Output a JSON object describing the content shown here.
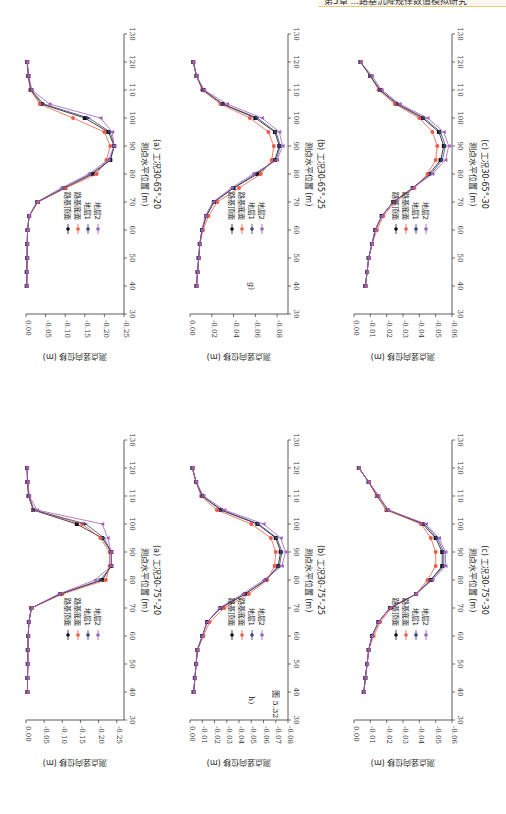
{
  "header": {
    "running_title": "第5章 ...路基沉降规律数值模拟研究"
  },
  "figure": {
    "number_label": "图 5.32",
    "row_labels": [
      "g)",
      "h)"
    ]
  },
  "legend": {
    "items": [
      {
        "label": "路基顶面",
        "color": "#111111",
        "marker": "square"
      },
      {
        "label": "路基底面",
        "color": "#ee5a45",
        "marker": "circle"
      },
      {
        "label": "地层1",
        "color": "#3b3f7a",
        "marker": "triangle-up"
      },
      {
        "label": "地层2",
        "color": "#a060b8",
        "marker": "triangle-down"
      }
    ]
  },
  "axes": {
    "xlabel": "测点水平位置 (m)",
    "ylabel": "测点竖向位移 (m)",
    "xticks": [
      30,
      40,
      50,
      60,
      70,
      80,
      90,
      100,
      110,
      120,
      130
    ]
  },
  "chart_data": [
    {
      "type": "line",
      "id": "g_a",
      "title": "(a) 工况30-65°-20",
      "xlabel": "测点水平位置 (m)",
      "ylabel": "测点竖向位移 (m)",
      "xlim": [
        30,
        130
      ],
      "ylim": [
        -0.25,
        0.0
      ],
      "yticks": [
        0.0,
        -0.05,
        -0.1,
        -0.15,
        -0.2,
        -0.25
      ],
      "x": [
        40,
        45,
        50,
        55,
        60,
        65,
        70,
        75,
        80,
        85,
        90,
        95,
        100,
        105,
        110,
        115,
        120
      ],
      "series": [
        {
          "name": "路基顶面",
          "values": [
            -0.002,
            -0.002,
            -0.003,
            -0.003,
            -0.004,
            -0.008,
            -0.03,
            -0.1,
            -0.17,
            -0.215,
            -0.225,
            -0.21,
            -0.15,
            -0.04,
            -0.012,
            -0.006,
            -0.003
          ]
        },
        {
          "name": "路基底面",
          "values": [
            -0.002,
            -0.002,
            -0.003,
            -0.003,
            -0.004,
            -0.008,
            -0.03,
            -0.1,
            -0.18,
            -0.205,
            -0.215,
            -0.2,
            -0.12,
            -0.035,
            -0.011,
            -0.005,
            -0.003
          ]
        },
        {
          "name": "地层1",
          "values": [
            -0.002,
            -0.002,
            -0.003,
            -0.003,
            -0.004,
            -0.008,
            -0.028,
            -0.095,
            -0.165,
            -0.215,
            -0.225,
            -0.215,
            -0.16,
            -0.045,
            -0.013,
            -0.006,
            -0.003
          ]
        },
        {
          "name": "地层2",
          "values": [
            -0.002,
            -0.002,
            -0.003,
            -0.003,
            -0.004,
            -0.008,
            -0.028,
            -0.09,
            -0.16,
            -0.21,
            -0.225,
            -0.22,
            -0.19,
            -0.06,
            -0.015,
            -0.007,
            -0.003
          ]
        }
      ]
    },
    {
      "type": "line",
      "id": "g_b",
      "title": "(b) 工况30-65°-25",
      "xlabel": "测点水平位置 (m)",
      "ylabel": "测点竖向位移 (m)",
      "xlim": [
        30,
        130
      ],
      "ylim": [
        -0.09,
        0.0
      ],
      "yticks": [
        0.0,
        -0.02,
        -0.04,
        -0.06,
        -0.08
      ],
      "x": [
        40,
        45,
        50,
        55,
        60,
        65,
        70,
        75,
        80,
        85,
        90,
        95,
        100,
        105,
        110,
        115,
        120
      ],
      "series": [
        {
          "name": "路基顶面",
          "values": [
            -0.006,
            -0.007,
            -0.008,
            -0.009,
            -0.011,
            -0.015,
            -0.022,
            -0.04,
            -0.062,
            -0.078,
            -0.082,
            -0.078,
            -0.06,
            -0.03,
            -0.012,
            -0.006,
            -0.003
          ]
        },
        {
          "name": "路基底面",
          "values": [
            -0.006,
            -0.007,
            -0.008,
            -0.009,
            -0.012,
            -0.017,
            -0.025,
            -0.045,
            -0.065,
            -0.075,
            -0.077,
            -0.072,
            -0.055,
            -0.028,
            -0.011,
            -0.006,
            -0.003
          ]
        },
        {
          "name": "地层1",
          "values": [
            -0.006,
            -0.007,
            -0.008,
            -0.009,
            -0.011,
            -0.015,
            -0.022,
            -0.04,
            -0.06,
            -0.079,
            -0.083,
            -0.079,
            -0.062,
            -0.03,
            -0.012,
            -0.006,
            -0.003
          ]
        },
        {
          "name": "地层2",
          "values": [
            -0.006,
            -0.007,
            -0.008,
            -0.009,
            -0.011,
            -0.014,
            -0.021,
            -0.038,
            -0.058,
            -0.08,
            -0.085,
            -0.082,
            -0.066,
            -0.034,
            -0.013,
            -0.006,
            -0.003
          ]
        }
      ]
    },
    {
      "type": "line",
      "id": "g_c",
      "title": "(c) 工况30-65°-30",
      "xlabel": "测点水平位置 (m)",
      "ylabel": "测点竖向位移 (m)",
      "xlim": [
        30,
        130
      ],
      "ylim": [
        -0.06,
        0.0
      ],
      "yticks": [
        0.0,
        -0.01,
        -0.02,
        -0.03,
        -0.04,
        -0.05,
        -0.06
      ],
      "x": [
        40,
        45,
        50,
        55,
        60,
        65,
        70,
        75,
        80,
        85,
        90,
        95,
        100,
        105,
        110,
        115,
        120
      ],
      "series": [
        {
          "name": "路基顶面",
          "values": [
            -0.007,
            -0.008,
            -0.009,
            -0.011,
            -0.013,
            -0.017,
            -0.024,
            -0.036,
            -0.046,
            -0.053,
            -0.055,
            -0.052,
            -0.042,
            -0.026,
            -0.016,
            -0.01,
            -0.004
          ]
        },
        {
          "name": "路基底面",
          "values": [
            -0.007,
            -0.008,
            -0.009,
            -0.011,
            -0.014,
            -0.018,
            -0.025,
            -0.037,
            -0.045,
            -0.05,
            -0.051,
            -0.048,
            -0.04,
            -0.025,
            -0.015,
            -0.01,
            -0.004
          ]
        },
        {
          "name": "地层1",
          "values": [
            -0.007,
            -0.008,
            -0.009,
            -0.011,
            -0.013,
            -0.017,
            -0.024,
            -0.036,
            -0.047,
            -0.054,
            -0.056,
            -0.053,
            -0.043,
            -0.027,
            -0.016,
            -0.01,
            -0.004
          ]
        },
        {
          "name": "地层2",
          "values": [
            -0.007,
            -0.008,
            -0.009,
            -0.011,
            -0.013,
            -0.017,
            -0.024,
            -0.036,
            -0.048,
            -0.056,
            -0.058,
            -0.055,
            -0.045,
            -0.028,
            -0.017,
            -0.011,
            -0.004
          ]
        }
      ]
    },
    {
      "type": "line",
      "id": "h_a",
      "title": "(a) 工况30-75°-20",
      "xlabel": "测点水平位置 (m)",
      "ylabel": "测点竖向位移 (m)",
      "xlim": [
        30,
        130
      ],
      "ylim": [
        -0.27,
        0.0
      ],
      "yticks": [
        0.0,
        -0.05,
        -0.1,
        -0.15,
        -0.2,
        -0.25
      ],
      "x": [
        40,
        45,
        50,
        55,
        60,
        65,
        70,
        75,
        80,
        85,
        90,
        95,
        100,
        105,
        110,
        115,
        120
      ],
      "series": [
        {
          "name": "路基顶面",
          "values": [
            -0.004,
            -0.004,
            -0.005,
            -0.005,
            -0.006,
            -0.008,
            -0.015,
            -0.095,
            -0.21,
            -0.235,
            -0.235,
            -0.21,
            -0.14,
            -0.02,
            -0.007,
            -0.004,
            -0.003
          ]
        },
        {
          "name": "路基底面",
          "values": [
            -0.004,
            -0.004,
            -0.005,
            -0.005,
            -0.006,
            -0.008,
            -0.015,
            -0.1,
            -0.22,
            -0.23,
            -0.23,
            -0.205,
            -0.155,
            -0.02,
            -0.007,
            -0.004,
            -0.003
          ]
        },
        {
          "name": "地层1",
          "values": [
            -0.004,
            -0.004,
            -0.005,
            -0.005,
            -0.006,
            -0.008,
            -0.015,
            -0.095,
            -0.205,
            -0.235,
            -0.235,
            -0.215,
            -0.165,
            -0.022,
            -0.008,
            -0.004,
            -0.003
          ]
        },
        {
          "name": "地层2",
          "values": [
            -0.004,
            -0.004,
            -0.005,
            -0.005,
            -0.006,
            -0.008,
            -0.015,
            -0.09,
            -0.19,
            -0.235,
            -0.235,
            -0.225,
            -0.21,
            -0.03,
            -0.009,
            -0.005,
            -0.003
          ]
        }
      ]
    },
    {
      "type": "line",
      "id": "h_b",
      "title": "(b) 工况30-75°-25",
      "xlabel": "测点水平位置 (m)",
      "ylabel": "测点竖向位移 (m)",
      "xlim": [
        30,
        130
      ],
      "ylim": [
        -0.08,
        0.0
      ],
      "yticks": [
        0.0,
        -0.01,
        -0.02,
        -0.03,
        -0.04,
        -0.05,
        -0.06,
        -0.07,
        -0.08
      ],
      "x": [
        40,
        45,
        50,
        55,
        60,
        65,
        70,
        75,
        80,
        85,
        90,
        95,
        100,
        105,
        110,
        115,
        120
      ],
      "series": [
        {
          "name": "路基顶面",
          "values": [
            -0.003,
            -0.004,
            -0.005,
            -0.006,
            -0.01,
            -0.014,
            -0.025,
            -0.045,
            -0.062,
            -0.072,
            -0.074,
            -0.07,
            -0.055,
            -0.025,
            -0.01,
            -0.005,
            -0.002
          ]
        },
        {
          "name": "路基底面",
          "values": [
            -0.003,
            -0.004,
            -0.005,
            -0.006,
            -0.011,
            -0.016,
            -0.028,
            -0.048,
            -0.063,
            -0.069,
            -0.07,
            -0.066,
            -0.05,
            -0.022,
            -0.009,
            -0.005,
            -0.002
          ]
        },
        {
          "name": "地层1",
          "values": [
            -0.003,
            -0.004,
            -0.005,
            -0.006,
            -0.01,
            -0.014,
            -0.025,
            -0.045,
            -0.062,
            -0.073,
            -0.075,
            -0.071,
            -0.056,
            -0.026,
            -0.01,
            -0.005,
            -0.002
          ]
        },
        {
          "name": "地层2",
          "values": [
            -0.003,
            -0.004,
            -0.005,
            -0.006,
            -0.01,
            -0.014,
            -0.024,
            -0.043,
            -0.06,
            -0.075,
            -0.078,
            -0.074,
            -0.06,
            -0.028,
            -0.011,
            -0.005,
            -0.002
          ]
        }
      ]
    },
    {
      "type": "line",
      "id": "h_c",
      "title": "(c) 工况30-75°-30",
      "xlabel": "测点水平位置 (m)",
      "ylabel": "测点竖向位移 (m)",
      "xlim": [
        30,
        130
      ],
      "ylim": [
        -0.06,
        0.0
      ],
      "yticks": [
        0.0,
        -0.01,
        -0.02,
        -0.03,
        -0.04,
        -0.05,
        -0.06
      ],
      "x": [
        40,
        45,
        50,
        55,
        60,
        65,
        70,
        75,
        80,
        85,
        90,
        95,
        100,
        105,
        110,
        115,
        120
      ],
      "series": [
        {
          "name": "路基顶面",
          "values": [
            -0.006,
            -0.007,
            -0.008,
            -0.009,
            -0.011,
            -0.015,
            -0.022,
            -0.038,
            -0.047,
            -0.054,
            -0.054,
            -0.05,
            -0.042,
            -0.02,
            -0.014,
            -0.009,
            -0.003
          ]
        },
        {
          "name": "路基底面",
          "values": [
            -0.006,
            -0.007,
            -0.008,
            -0.009,
            -0.012,
            -0.016,
            -0.023,
            -0.038,
            -0.045,
            -0.05,
            -0.05,
            -0.047,
            -0.041,
            -0.02,
            -0.014,
            -0.009,
            -0.003
          ]
        },
        {
          "name": "地层1",
          "values": [
            -0.006,
            -0.007,
            -0.008,
            -0.009,
            -0.011,
            -0.015,
            -0.022,
            -0.038,
            -0.047,
            -0.055,
            -0.055,
            -0.051,
            -0.043,
            -0.021,
            -0.015,
            -0.009,
            -0.003
          ]
        },
        {
          "name": "地层2",
          "values": [
            -0.006,
            -0.007,
            -0.008,
            -0.009,
            -0.011,
            -0.015,
            -0.022,
            -0.038,
            -0.048,
            -0.056,
            -0.056,
            -0.052,
            -0.044,
            -0.021,
            -0.015,
            -0.009,
            -0.003
          ]
        }
      ]
    }
  ]
}
